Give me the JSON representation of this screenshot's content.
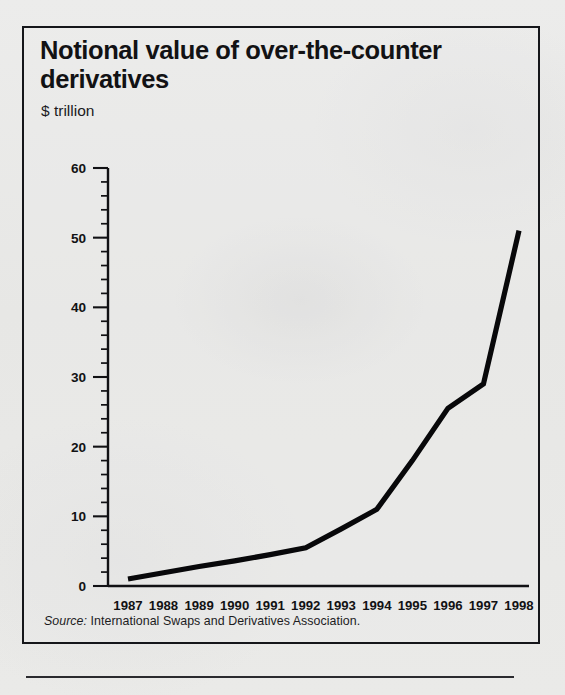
{
  "figure": {
    "title": "Notional value of over-the-counter derivatives",
    "subtitle": "$ trillion",
    "source_prefix": "Source:",
    "source_text": " International Swaps and Derivatives Association."
  },
  "colors": {
    "line": "#08080a",
    "axis": "#111114",
    "border": "#15161a",
    "paper": "#e9e9e7"
  },
  "chart_data": {
    "type": "line",
    "title": "Notional value of over-the-counter derivatives",
    "subtitle": "$ trillion",
    "xlabel": "",
    "ylabel": "$ trillion",
    "categories": [
      "1987",
      "1988",
      "1989",
      "1990",
      "1991",
      "1992",
      "1993",
      "1994",
      "1995",
      "1996",
      "1997",
      "1998"
    ],
    "x": [
      1987,
      1988,
      1989,
      1990,
      1991,
      1992,
      1993,
      1994,
      1995,
      1996,
      1997,
      1998
    ],
    "values": [
      1.0,
      1.9,
      2.8,
      3.6,
      4.5,
      5.5,
      8.2,
      11.0,
      18.0,
      25.5,
      29.0,
      51.0
    ],
    "series": [
      {
        "name": "Notional value of OTC derivatives",
        "values": [
          1.0,
          1.9,
          2.8,
          3.6,
          4.5,
          5.5,
          8.2,
          11.0,
          18.0,
          25.5,
          29.0,
          51.0
        ]
      }
    ],
    "ylim": [
      0,
      60
    ],
    "xlim": [
      1987,
      1998
    ],
    "ytick_labels": [
      "0",
      "10",
      "20",
      "30",
      "40",
      "50",
      "60"
    ],
    "yticks": [
      0,
      10,
      20,
      30,
      40,
      50,
      60
    ],
    "yminor_step": 2,
    "grid": false,
    "legend": false,
    "legend_position": "none",
    "source": "Source: International Swaps and Derivatives Association."
  }
}
